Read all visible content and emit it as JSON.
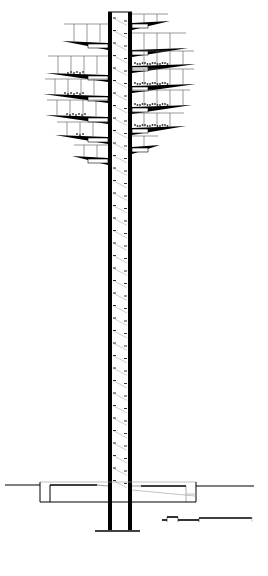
{
  "drawing": {
    "type": "architectural-section",
    "subject": "observation tower with cantilevered platforms",
    "colors": {
      "background": "#ffffff",
      "ink": "#000000",
      "thin_line": "#555555",
      "light_line": "#999999"
    }
  },
  "shaft": {
    "left_wall_x": 108,
    "right_wall_x": 128,
    "wall_width": 4,
    "top_y": 12,
    "bottom_y": 530,
    "stair_step_spacing": 12.5
  },
  "platforms": {
    "left": [
      {
        "y": 44,
        "reach_x": 62,
        "rail_h": 22
      },
      {
        "y": 76,
        "reach_x": 46,
        "rail_h": 22
      },
      {
        "y": 97,
        "reach_x": 43,
        "rail_h": 20
      },
      {
        "y": 118,
        "reach_x": 45,
        "rail_h": 20
      },
      {
        "y": 138,
        "reach_x": 55,
        "rail_h": 18
      },
      {
        "y": 159,
        "reach_x": 72,
        "rail_h": 16
      }
    ],
    "right": [
      {
        "y": 24,
        "reach_x": 170,
        "rail_h": 12
      },
      {
        "y": 51,
        "reach_x": 188,
        "rail_h": 20
      },
      {
        "y": 67,
        "reach_x": 196,
        "rail_h": 18
      },
      {
        "y": 87,
        "reach_x": 196,
        "rail_h": 20
      },
      {
        "y": 108,
        "reach_x": 192,
        "rail_h": 20
      },
      {
        "y": 129,
        "reach_x": 186,
        "rail_h": 18
      },
      {
        "y": 148,
        "reach_x": 160,
        "rail_h": 14
      }
    ]
  },
  "ground": {
    "y": 485,
    "left_x": 5,
    "right_x": 254
  },
  "foundation": {
    "left_x": 40,
    "right_x": 196,
    "top_y": 482,
    "bottom_y": 502,
    "inner_left_x": 50,
    "inner_right_x": 186
  },
  "footing": {
    "y": 531,
    "left_x": 95,
    "right_x": 140
  },
  "scale_bar": {
    "y": 520,
    "x_start": 162,
    "x_end": 252,
    "segments": [
      {
        "x1": 162,
        "x2": 167,
        "offset": 0
      },
      {
        "x1": 167,
        "x2": 178,
        "offset": -3
      },
      {
        "x1": 178,
        "x2": 199,
        "offset": 0
      },
      {
        "x1": 199,
        "x2": 252,
        "offset": -2
      }
    ]
  }
}
